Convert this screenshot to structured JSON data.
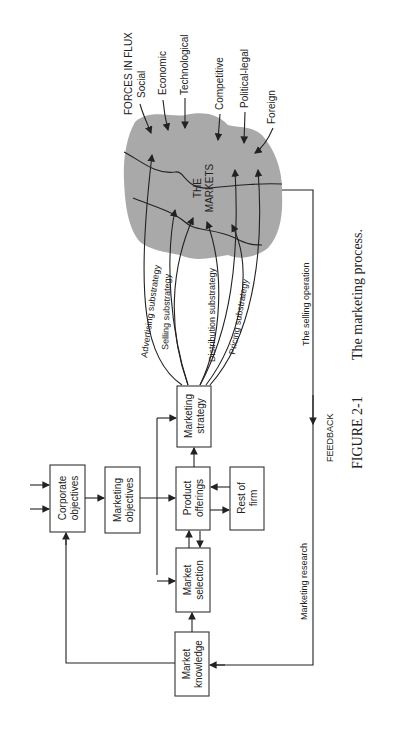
{
  "figure": {
    "number": "FIGURE 2-1",
    "title": "The marketing process.",
    "orientation": "rotated 90° counter-clockwise"
  },
  "boxes": {
    "corporate_objectives": [
      "Corporate",
      "objectives"
    ],
    "marketing_objectives": [
      "Marketing",
      "objectives"
    ],
    "product_offerings": [
      "Product",
      "offerings"
    ],
    "rest_of_firm": [
      "Rest of",
      "firm"
    ],
    "marketing_strategy": [
      "Marketing",
      "strategy"
    ],
    "market_selection": [
      "Market",
      "selection"
    ],
    "market_knowledge": [
      "Market",
      "knowledge"
    ]
  },
  "markets": {
    "label_line1": "THE",
    "label_line2": "MARKETS",
    "color": "#a9a9a9"
  },
  "forces": {
    "heading": "FORCES IN FLUX",
    "items": [
      "Social",
      "Economic",
      "Technological",
      "Competitive",
      "Political-legal",
      "Foreign"
    ]
  },
  "substrategies": [
    "Advertising substrategy",
    "Selling substrategy",
    "Distribution substrategy",
    "Pricing substrategy"
  ],
  "feedback": {
    "label": "FEEDBACK",
    "selling_operation": "The selling operation",
    "marketing_research": "Marketing research"
  }
}
